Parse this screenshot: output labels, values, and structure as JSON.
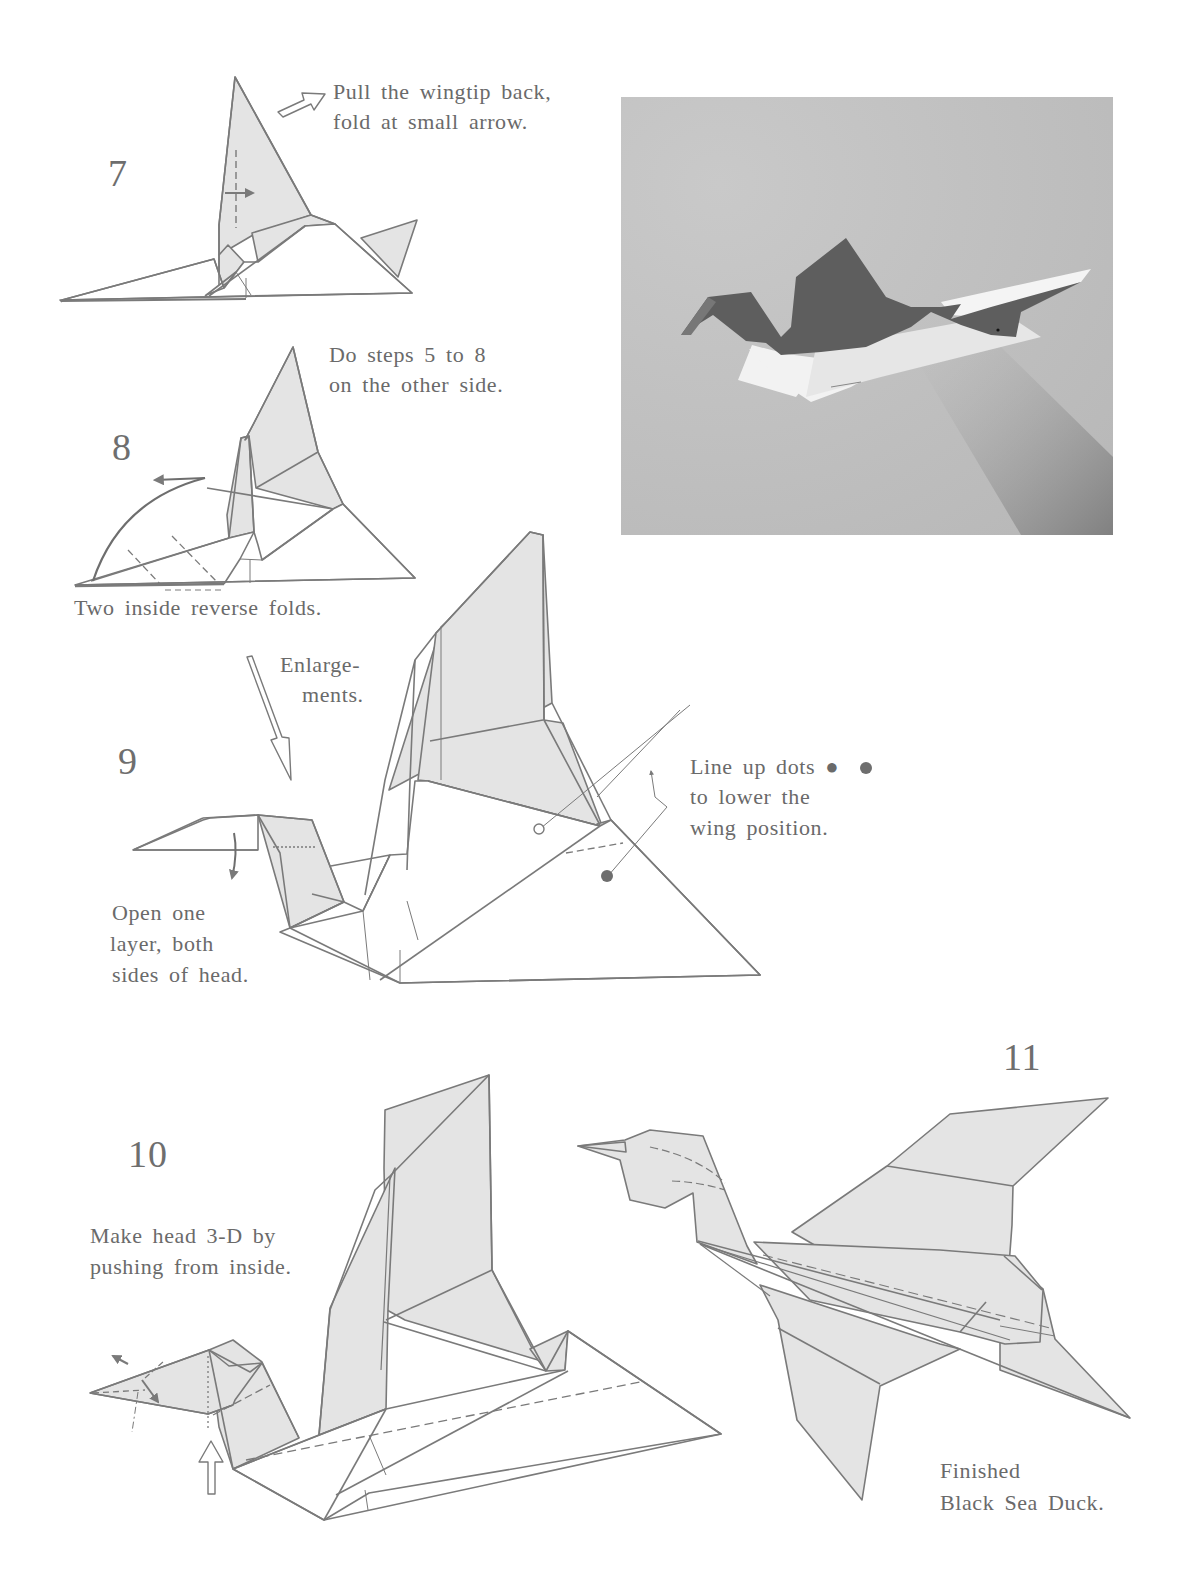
{
  "page": {
    "colors": {
      "paper_shade": "#e4e4e4",
      "line": "#7a7a7a",
      "text": "#6a6a6a",
      "photo_background": "#c2c2c2",
      "photo_model_dark": "#5e5e5e",
      "photo_model_light": "#f2f2f2"
    }
  },
  "steps": [
    {
      "number": "7",
      "captions": [
        "Pull the wingtip back,",
        "fold at small arrow."
      ]
    },
    {
      "number": "8",
      "captions": [
        "Do steps 5 to 8",
        "on the other side."
      ],
      "bottom_caption": "Two inside reverse folds."
    },
    {
      "number": "9",
      "transition_note": [
        "Enlarge-",
        "ments."
      ],
      "captions": [
        "Line up dots ●",
        "to lower the",
        "wing position."
      ],
      "head_caption": [
        "Open one",
        "layer, both",
        "sides of head."
      ]
    },
    {
      "number": "10",
      "captions": [
        "Make head 3-D by",
        "pushing from inside."
      ]
    },
    {
      "number": "11",
      "captions": [
        "Finished",
        "Black Sea Duck."
      ]
    }
  ],
  "photo": {
    "description": "Photograph of the finished origami Black Sea Duck in flight on a grey background",
    "icon": "photo-finished-duck"
  },
  "icons": {
    "outline_arrow": "hollow-arrow-icon",
    "curved_arrow": "curved-arrow-icon",
    "push_arrow": "push-arrow-icon",
    "dot_filled": "filled-dot-icon",
    "dot_hollow": "hollow-dot-icon"
  }
}
